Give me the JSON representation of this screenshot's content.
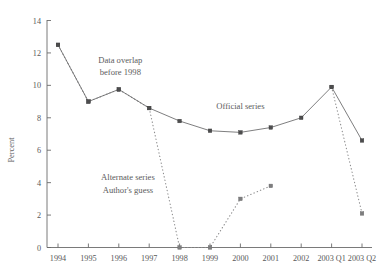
{
  "chart_data": {
    "type": "line",
    "title": "",
    "xlabel": "",
    "ylabel": "Percent",
    "ylim": [
      0,
      14
    ],
    "yticks": [
      0,
      2,
      4,
      6,
      8,
      10,
      12,
      14
    ],
    "grid": false,
    "legend_position": "none",
    "categories": [
      "1994",
      "1995",
      "1996",
      "1997",
      "1998",
      "1999",
      "2000",
      "2001",
      "2002",
      "2003 Q1",
      "2003 Q2"
    ],
    "series": [
      {
        "name": "Official series",
        "style": "solid",
        "marker": "square",
        "values": [
          12.5,
          9.0,
          9.75,
          8.6,
          7.8,
          7.2,
          7.1,
          7.4,
          8.0,
          9.9,
          6.6
        ]
      },
      {
        "name": "Alternate series",
        "style": "dotted",
        "marker": "square",
        "values": [
          12.5,
          9.0,
          9.75,
          8.6,
          0.0,
          0.0,
          3.0,
          3.8,
          null,
          9.9,
          2.1
        ]
      }
    ],
    "annotations": [
      {
        "id": "data-overlap",
        "line1": "Data overlap",
        "line2": "before 1998",
        "x": 1996.05,
        "y": 11.4
      },
      {
        "id": "official-series",
        "line1": "Official series",
        "line2": "",
        "x": 2000.0,
        "y": 8.55
      },
      {
        "id": "alternate-series",
        "line1": "Alternate series",
        "line2": "Author's guess",
        "x": 1996.3,
        "y": 4.15
      }
    ]
  },
  "axis": {
    "y_title": "Percent",
    "y_tick_labels": [
      "0",
      "2",
      "4",
      "6",
      "8",
      "10",
      "12",
      "14"
    ],
    "x_tick_labels": [
      "1994",
      "1995",
      "1996",
      "1997",
      "1998",
      "1999",
      "2000",
      "2001",
      "2002",
      "2003 Q1",
      "2003 Q2"
    ]
  },
  "colors": {
    "background": "#ffffff",
    "axis": "#6b6b6b",
    "official_line": "#6f6f70",
    "alternate_line": "#8e8e8f",
    "marker": "#4d4d4e",
    "text": "#59595a"
  }
}
